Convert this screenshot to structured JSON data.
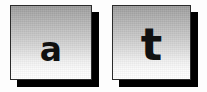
{
  "canvas": {
    "width": 207,
    "height": 92,
    "background_color": "#fdfdfd"
  },
  "style": {
    "tile_border_color": "#2b2b2b",
    "tile_shadow_color": "#000000",
    "tile_gradient_top_color": "#9a9a9a",
    "tile_gradient_bottom_color": "#ffffff",
    "letter_color": "#111111"
  },
  "tiles": [
    {
      "id": "tile-a",
      "letter": "a",
      "name": "letter-tile-a"
    },
    {
      "id": "tile-t",
      "letter": "t",
      "name": "letter-tile-t"
    }
  ]
}
